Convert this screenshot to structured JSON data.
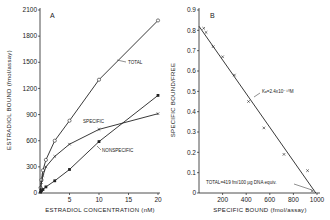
{
  "chart_data": [
    {
      "panel": "A",
      "type": "line",
      "xlabel": "ESTRADIOL CONCENTRATION (nM)",
      "ylabel": "ESTRADIOL BOUND (fmol/assay)",
      "xlim": [
        0,
        20
      ],
      "ylim": [
        0,
        2100
      ],
      "xticks": [
        0,
        5,
        10,
        15,
        20
      ],
      "yticks": [
        0,
        300,
        600,
        900,
        1200,
        1500,
        1800,
        2100
      ],
      "grid": false,
      "series": [
        {
          "name": "TOTAL",
          "marker": "open-circle",
          "x": [
            0.1,
            0.25,
            0.5,
            1,
            2.5,
            5,
            10,
            20
          ],
          "y": [
            60,
            150,
            260,
            380,
            600,
            830,
            1300,
            1980
          ]
        },
        {
          "name": "SPECIFIC",
          "marker": "x",
          "x": [
            0.1,
            0.25,
            0.5,
            1,
            2.5,
            5,
            10,
            20
          ],
          "y": [
            50,
            120,
            200,
            300,
            420,
            560,
            730,
            910
          ]
        },
        {
          "name": "NONSPECIFIC",
          "marker": "filled-square",
          "x": [
            0.1,
            0.25,
            0.5,
            1,
            2.5,
            5,
            10,
            20
          ],
          "y": [
            10,
            25,
            40,
            70,
            140,
            270,
            590,
            1120
          ]
        }
      ],
      "annotations": [
        "TOTAL",
        "SPECIFIC",
        "NONSPECIFIC"
      ]
    },
    {
      "panel": "B",
      "type": "scatter",
      "xlabel": "SPECIFIC BOUND (fmol/assay)",
      "ylabel": "SPECIFIC BOUND/FREE",
      "xlim": [
        0,
        1000
      ],
      "ylim": [
        0,
        0.9
      ],
      "xticks": [
        0,
        200,
        400,
        600,
        800,
        1000
      ],
      "yticks": [
        0,
        0.1,
        0.2,
        0.3,
        0.4,
        0.5,
        0.6,
        0.7,
        0.8,
        0.9
      ],
      "grid": false,
      "series": [
        {
          "name": "data",
          "marker": "x",
          "x": [
            40,
            60,
            120,
            200,
            300,
            420,
            550,
            720,
            920,
            960
          ],
          "y": [
            0.81,
            0.79,
            0.72,
            0.67,
            0.58,
            0.45,
            0.32,
            0.19,
            0.11,
            0.01
          ]
        },
        {
          "name": "fit",
          "type": "line",
          "x": [
            0,
            990
          ],
          "y": [
            0.82,
            0
          ]
        }
      ],
      "annotations": [
        "Kd = 2.4×10⁻¹⁰ M",
        "TOTAL = 419 fm/100 µg DNA equiv."
      ]
    }
  ],
  "labels": {
    "panelA": "A",
    "panelB": "B",
    "a_xlabel": "ESTRADIOL  CONCENTRATION (nM)",
    "a_ylabel": "ESTRADIOL BOUND (fmol/assay)",
    "b_xlabel": "SPECIFIC  BOUND (fmol/assay)",
    "b_ylabel": "SPECIFIC BOUND/FREE",
    "total": "TOTAL",
    "specific": "SPECIFIC",
    "nonspecific": "NONSPECIFIC",
    "kd": "Kₐ=2.4x10⁻¹⁰M",
    "total_b": "TOTAL=419 fm/100 µg DNA equiv."
  }
}
